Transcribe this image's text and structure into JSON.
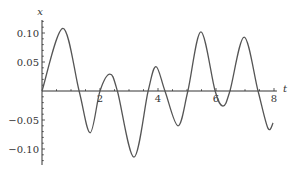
{
  "chart_data": {
    "type": "line",
    "title": "",
    "xlabel": "t",
    "ylabel": "x",
    "xlim": [
      0,
      8
    ],
    "ylim": [
      -0.12,
      0.12
    ],
    "x_ticks": [
      2,
      4,
      6,
      8
    ],
    "x_tick_labels": [
      "2",
      "4",
      "6",
      "8"
    ],
    "x_minor_step": 0.5,
    "y_ticks": [
      0.1,
      0.05,
      -0.05,
      -0.1
    ],
    "y_tick_labels": [
      "0.10",
      "0.05",
      "−0.05",
      "−0.10"
    ],
    "y_minor_step": 0.01,
    "grid": false,
    "legend": "none",
    "series": [
      {
        "name": "x(t)",
        "color": "#555555",
        "points": [
          [
            0.0,
            0.0
          ],
          [
            0.72,
            0.108
          ],
          [
            1.28,
            0.0
          ],
          [
            1.66,
            -0.072
          ],
          [
            2.0,
            0.0
          ],
          [
            2.34,
            0.029
          ],
          [
            2.6,
            0.0
          ],
          [
            3.17,
            -0.114
          ],
          [
            3.66,
            0.0
          ],
          [
            3.93,
            0.042
          ],
          [
            4.24,
            0.0
          ],
          [
            4.69,
            -0.06
          ],
          [
            5.03,
            0.0
          ],
          [
            5.48,
            0.102
          ],
          [
            5.97,
            0.0
          ],
          [
            6.24,
            -0.026
          ],
          [
            6.48,
            0.0
          ],
          [
            6.97,
            0.093
          ],
          [
            7.45,
            0.0
          ],
          [
            7.79,
            -0.064
          ],
          [
            7.97,
            -0.055
          ]
        ]
      }
    ]
  }
}
